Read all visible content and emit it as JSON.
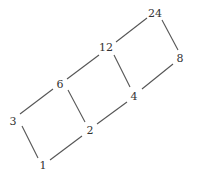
{
  "diagram": {
    "type": "hasse-diagram",
    "nodes": [
      {
        "id": "1",
        "label": "1",
        "x": 43,
        "y": 165
      },
      {
        "id": "2",
        "label": "2",
        "x": 90,
        "y": 130
      },
      {
        "id": "3",
        "label": "3",
        "x": 13,
        "y": 121
      },
      {
        "id": "4",
        "label": "4",
        "x": 134,
        "y": 96
      },
      {
        "id": "6",
        "label": "6",
        "x": 60,
        "y": 84
      },
      {
        "id": "8",
        "label": "8",
        "x": 180,
        "y": 58
      },
      {
        "id": "12",
        "label": "12",
        "x": 106,
        "y": 47
      },
      {
        "id": "24",
        "label": "24",
        "x": 155,
        "y": 13
      }
    ],
    "edges": [
      [
        "1",
        "2"
      ],
      [
        "1",
        "3"
      ],
      [
        "2",
        "4"
      ],
      [
        "2",
        "6"
      ],
      [
        "3",
        "6"
      ],
      [
        "4",
        "8"
      ],
      [
        "4",
        "12"
      ],
      [
        "6",
        "12"
      ],
      [
        "8",
        "24"
      ],
      [
        "12",
        "24"
      ]
    ]
  }
}
